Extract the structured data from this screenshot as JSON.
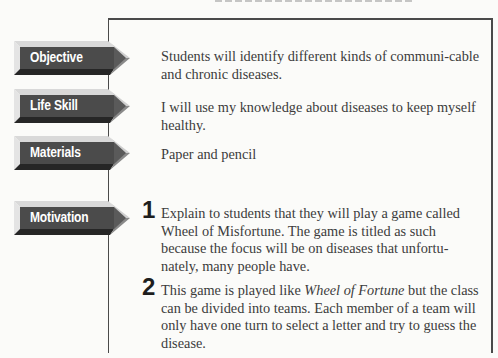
{
  "page": {
    "heading_clipped": true
  },
  "sections": [
    {
      "label": "Objective",
      "text": "Students will identify different kinds of communi-cable and chronic diseases."
    },
    {
      "label": "Life Skill",
      "text": "I will use my knowledge about diseases to keep myself healthy."
    },
    {
      "label": "Materials",
      "text": "Paper and pencil"
    },
    {
      "label": "Motivation"
    }
  ],
  "steps": [
    {
      "number": "1",
      "text": "Explain to students that they will play a game called Wheel of Misfortune.  The game is titled as such because the focus will be on diseases that unfortu-nately, many people have."
    },
    {
      "number": "2",
      "text_before": "This game is played like ",
      "text_italic": "Wheel of Fortune",
      "text_after": " but the class can be divided into teams.  Each member of a team will only have one turn to select a letter and try to guess the disease."
    }
  ],
  "colors": {
    "label_body": "#4b4b4b",
    "label_top_bevel": "#d6d6d6",
    "label_bottom_bevel": "#2a2a2a",
    "label_tip_highlight": "#c8c8c8",
    "frame": "#4a4a4a",
    "text": "#3c3c3c"
  }
}
